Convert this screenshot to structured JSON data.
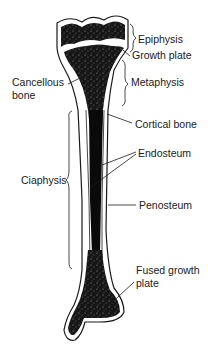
{
  "diagram": {
    "colors": {
      "bone_fill": "#111111",
      "outline": "#1a1a1a",
      "background": "#ffffff",
      "text": "#1a1a1a"
    },
    "labels": {
      "epiphysis": "Epiphysis",
      "growth_plate": "Growth plate",
      "metaphysis": "Metaphysis",
      "cancellous_bone_line1": "Cancellous",
      "cancellous_bone_line2": "bone",
      "cortical_bone": "Cortical bone",
      "endosteum": "Endosteum",
      "ciaphysis": "Ciaphysis",
      "penosteum": "Penosteum",
      "fused_growth_plate_line1": "Fused growth",
      "fused_growth_plate_line2": "plate"
    }
  }
}
